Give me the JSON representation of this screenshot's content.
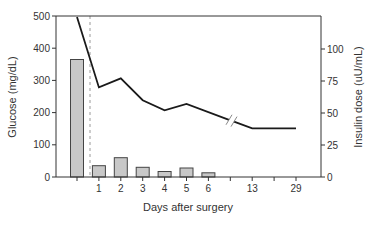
{
  "chart_data": {
    "type": "bar+line",
    "title": "",
    "xlabel": "Days after surgery",
    "x_categories": [
      "pre-op",
      "1",
      "2",
      "3",
      "4",
      "5",
      "6",
      "",
      "13",
      "",
      "29"
    ],
    "x_tick_labels": [
      "",
      "1",
      "2",
      "3",
      "4",
      "5",
      "6",
      "",
      "13",
      "",
      "29"
    ],
    "axis_break_between": [
      "6",
      "13"
    ],
    "surgery_marker": "dashed vertical line between pre-op and day 1",
    "left_axis": {
      "label": "Glucose (mg/dL)",
      "ticks": [
        0,
        100,
        200,
        300,
        400,
        500
      ],
      "ylim": [
        0,
        500
      ]
    },
    "right_axis": {
      "label": "Insulin dose (uU/mL)",
      "ticks": [
        0,
        25,
        50,
        75,
        100
      ],
      "ylim": [
        0,
        125
      ]
    },
    "series": [
      {
        "name": "Glucose",
        "type": "bar",
        "axis": "left",
        "x": [
          "pre-op",
          "1",
          "2",
          "3",
          "4",
          "5",
          "6"
        ],
        "values": [
          365,
          35,
          60,
          30,
          17,
          28,
          13
        ]
      },
      {
        "name": "Insulin dose",
        "type": "line",
        "axis": "right",
        "x": [
          "pre-op",
          "1",
          "2",
          "3",
          "4",
          "5",
          "13",
          "29"
        ],
        "values": [
          125,
          70,
          77,
          60,
          52,
          57,
          38,
          38
        ],
        "note": "first point exceeds plotted range (clipped at top)"
      }
    ],
    "grid": false,
    "legend": "none"
  },
  "labels": {
    "xlabel": "Days after surgery",
    "ylabel_left": "Glucose (mg/dL)",
    "ylabel_right": "Insulin dose (uU/mL)"
  }
}
